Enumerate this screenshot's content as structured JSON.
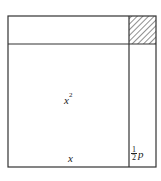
{
  "diagram": {
    "type": "completing-the-square",
    "labels": {
      "square_area": "x",
      "square_area_exponent": "2",
      "side": "x",
      "strip_width_numerator": "1",
      "strip_width_denominator": "2",
      "strip_width_variable": "p"
    },
    "colors": {
      "line": "#333333",
      "hatch": "#444444",
      "background": "#ffffff"
    }
  }
}
